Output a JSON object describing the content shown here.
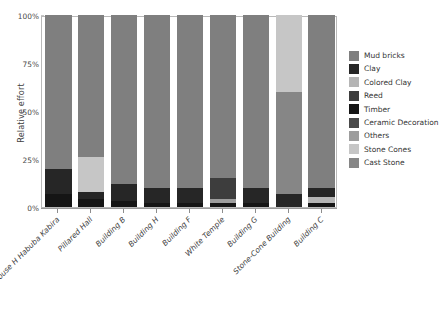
{
  "chart_data": {
    "type": "bar",
    "stacked": true,
    "stack_normalized": true,
    "title": "",
    "xlabel": "",
    "ylabel": "Relative effort",
    "ylim": [
      0,
      100
    ],
    "ytick_labels": [
      "0%",
      "25%",
      "50%",
      "75%",
      "100%"
    ],
    "ytick_values": [
      0,
      25,
      50,
      75,
      100
    ],
    "grid": false,
    "legend_position": "right",
    "categories": [
      "House H Habuba Kabira",
      "Pillared Hall",
      "Building B",
      "Building H",
      "Building F",
      "White Temple",
      "Building G",
      "Stone-Cone Building",
      "Building C"
    ],
    "series": [
      {
        "name": "Mud bricks",
        "color": "#7f7f7f",
        "values": [
          80,
          74,
          88,
          90,
          90,
          85,
          90,
          0,
          90
        ]
      },
      {
        "name": "Clay",
        "color": "#262626",
        "values": [
          13,
          4,
          9,
          8,
          8,
          0,
          8,
          7,
          5
        ]
      },
      {
        "name": "Colored Clay",
        "color": "#b5b5b5",
        "values": [
          0,
          0,
          0,
          0,
          0,
          0,
          0,
          0,
          3
        ]
      },
      {
        "name": "Reed",
        "color": "#3d3d3d",
        "values": [
          0,
          0,
          0,
          0,
          0,
          11,
          0,
          0,
          0
        ]
      },
      {
        "name": "Timber",
        "color": "#151515",
        "values": [
          7,
          4,
          3,
          2,
          2,
          2,
          2,
          0,
          2
        ]
      },
      {
        "name": "Ceramic Decoration",
        "color": "#4a4a4a",
        "values": [
          0,
          0,
          0,
          0,
          0,
          0,
          0,
          0,
          0
        ]
      },
      {
        "name": "Others",
        "color": "#9d9d9d",
        "values": [
          0,
          0,
          0,
          0,
          0,
          2,
          0,
          0,
          0
        ]
      },
      {
        "name": "Stone Cones",
        "color": "#c6c6c6",
        "values": [
          0,
          18,
          0,
          0,
          0,
          0,
          0,
          40,
          0
        ]
      },
      {
        "name": "Cast Stone",
        "color": "#868686",
        "values": [
          0,
          0,
          0,
          0,
          0,
          0,
          0,
          53,
          0
        ]
      }
    ],
    "stack_order_bottom_to_top": [
      "Timber",
      "Others",
      "Colored Clay",
      "Clay",
      "Reed",
      "Cast Stone",
      "Stone Cones",
      "Mud bricks"
    ]
  },
  "legend": {
    "items": [
      {
        "label": "Mud bricks",
        "color": "#7f7f7f"
      },
      {
        "label": "Clay",
        "color": "#262626"
      },
      {
        "label": "Colored Clay",
        "color": "#b5b5b5"
      },
      {
        "label": "Reed",
        "color": "#3d3d3d"
      },
      {
        "label": "Timber",
        "color": "#151515"
      },
      {
        "label": "Ceramic Decoration",
        "color": "#4a4a4a"
      },
      {
        "label": "Others",
        "color": "#9d9d9d"
      },
      {
        "label": "Stone Cones",
        "color": "#c6c6c6"
      },
      {
        "label": "Cast Stone",
        "color": "#868686"
      }
    ]
  },
  "axes": {
    "y_title": "Relative effort"
  },
  "colors": {
    "background": "#ffffff",
    "panel_border": "#b9b9b9",
    "axis_line": "#9a9a9a",
    "text": "#3f3f3f"
  }
}
